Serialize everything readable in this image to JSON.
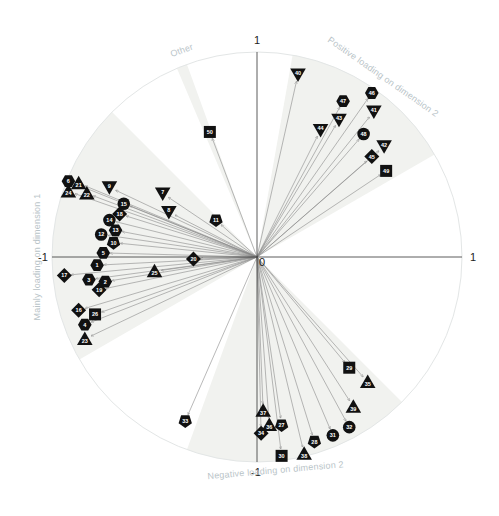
{
  "chart_data": {
    "type": "scatter",
    "subtype": "correlation-circle-biplot",
    "title": "",
    "xlabel": "Dimension 1",
    "ylabel": "Dimension 2",
    "xlim": [
      -1,
      1
    ],
    "ylim": [
      -1,
      1
    ],
    "grid": false,
    "legend": "none",
    "axis_ticks": {
      "x_left": "-1",
      "x_right": "1",
      "y_top": "1",
      "y_bottom": "-1",
      "origin": "0"
    },
    "regions": [
      {
        "name": "Mainly loading on dimension 1",
        "start_deg": 135,
        "end_deg": 210
      },
      {
        "name": "Positive loading on dimension 2",
        "start_deg": 30,
        "end_deg": 80
      },
      {
        "name": "Negative loading on dimension 2",
        "start_deg": 250,
        "end_deg": 315
      },
      {
        "name": "Other",
        "start_deg": 110,
        "end_deg": 113
      }
    ],
    "region_labels": [
      {
        "text": "Other",
        "angle_deg": 110
      },
      {
        "text": "Positive loading on dimension 2",
        "angle_deg": 55
      },
      {
        "text": "Mainly loading on dimension 1",
        "angle_deg": 180
      },
      {
        "text": "Negative loading on dimension 2",
        "angle_deg": 275
      }
    ],
    "points": [
      {
        "id": "1",
        "shape": "hexagon",
        "x": -0.78,
        "y": -0.04
      },
      {
        "id": "2",
        "shape": "hexagon",
        "x": -0.74,
        "y": -0.12
      },
      {
        "id": "3",
        "shape": "hexagon",
        "x": -0.82,
        "y": -0.11
      },
      {
        "id": "4",
        "shape": "hexagon",
        "x": -0.84,
        "y": -0.33
      },
      {
        "id": "5",
        "shape": "hexagon",
        "x": -0.75,
        "y": 0.02
      },
      {
        "id": "6",
        "shape": "hexagon",
        "x": -0.92,
        "y": 0.37
      },
      {
        "id": "7",
        "shape": "triangle-down",
        "x": -0.46,
        "y": 0.31
      },
      {
        "id": "8",
        "shape": "triangle-down",
        "x": -0.43,
        "y": 0.22
      },
      {
        "id": "9",
        "shape": "triangle-down",
        "x": -0.72,
        "y": 0.34
      },
      {
        "id": "10",
        "shape": "pentagon-down",
        "x": -0.7,
        "y": 0.07
      },
      {
        "id": "11",
        "shape": "pentagon-down",
        "x": -0.2,
        "y": 0.18
      },
      {
        "id": "12",
        "shape": "circle",
        "x": -0.76,
        "y": 0.11
      },
      {
        "id": "13",
        "shape": "hexagon",
        "x": -0.69,
        "y": 0.13
      },
      {
        "id": "14",
        "shape": "circle",
        "x": -0.72,
        "y": 0.18
      },
      {
        "id": "15",
        "shape": "circle",
        "x": -0.65,
        "y": 0.26
      },
      {
        "id": "16",
        "shape": "diamond",
        "x": -0.87,
        "y": -0.26
      },
      {
        "id": "17",
        "shape": "diamond",
        "x": -0.94,
        "y": -0.09
      },
      {
        "id": "18",
        "shape": "diamond",
        "x": -0.67,
        "y": 0.21
      },
      {
        "id": "19",
        "shape": "diamond",
        "x": -0.77,
        "y": -0.16
      },
      {
        "id": "20",
        "shape": "diamond",
        "x": -0.31,
        "y": -0.01
      },
      {
        "id": "21",
        "shape": "triangle-up",
        "x": -0.87,
        "y": 0.36
      },
      {
        "id": "22",
        "shape": "triangle-up",
        "x": -0.83,
        "y": 0.31
      },
      {
        "id": "23",
        "shape": "triangle-up",
        "x": -0.84,
        "y": -0.4
      },
      {
        "id": "24",
        "shape": "triangle-up",
        "x": -0.92,
        "y": 0.32
      },
      {
        "id": "25",
        "shape": "triangle-up",
        "x": -0.5,
        "y": -0.07
      },
      {
        "id": "26",
        "shape": "square",
        "x": -0.79,
        "y": -0.28
      },
      {
        "id": "27",
        "shape": "pentagon-down",
        "x": 0.12,
        "y": -0.82
      },
      {
        "id": "28",
        "shape": "pentagon-down",
        "x": 0.28,
        "y": -0.9
      },
      {
        "id": "29",
        "shape": "square",
        "x": 0.45,
        "y": -0.54
      },
      {
        "id": "30",
        "shape": "square",
        "x": 0.12,
        "y": -0.97
      },
      {
        "id": "31",
        "shape": "circle",
        "x": 0.37,
        "y": -0.87
      },
      {
        "id": "32",
        "shape": "circle",
        "x": 0.45,
        "y": -0.83
      },
      {
        "id": "33",
        "shape": "pentagon-down",
        "x": -0.35,
        "y": -0.8
      },
      {
        "id": "34",
        "shape": "diamond",
        "x": 0.02,
        "y": -0.86
      },
      {
        "id": "35",
        "shape": "triangle-up",
        "x": 0.54,
        "y": -0.61
      },
      {
        "id": "36",
        "shape": "triangle-up",
        "x": 0.06,
        "y": -0.82
      },
      {
        "id": "37",
        "shape": "triangle-up",
        "x": 0.03,
        "y": -0.75
      },
      {
        "id": "38",
        "shape": "triangle-up",
        "x": 0.23,
        "y": -0.96
      },
      {
        "id": "39",
        "shape": "triangle-up",
        "x": 0.47,
        "y": -0.73
      },
      {
        "id": "40",
        "shape": "triangle-down",
        "x": 0.2,
        "y": 0.89
      },
      {
        "id": "41",
        "shape": "triangle-down",
        "x": 0.57,
        "y": 0.71
      },
      {
        "id": "42",
        "shape": "triangle-down",
        "x": 0.62,
        "y": 0.54
      },
      {
        "id": "43",
        "shape": "triangle-down",
        "x": 0.4,
        "y": 0.67
      },
      {
        "id": "44",
        "shape": "triangle-down",
        "x": 0.31,
        "y": 0.62
      },
      {
        "id": "45",
        "shape": "diamond",
        "x": 0.56,
        "y": 0.49
      },
      {
        "id": "46",
        "shape": "hexagon",
        "x": 0.56,
        "y": 0.8
      },
      {
        "id": "47",
        "shape": "hexagon",
        "x": 0.42,
        "y": 0.76
      },
      {
        "id": "48",
        "shape": "circle",
        "x": 0.52,
        "y": 0.6
      },
      {
        "id": "49",
        "shape": "square",
        "x": 0.63,
        "y": 0.42
      },
      {
        "id": "50",
        "shape": "square",
        "x": -0.23,
        "y": 0.61
      }
    ]
  },
  "style": {
    "circle_stroke": "#e3e6e6",
    "sector_fill": "#f1f2ef",
    "arrow_color": "#8a8a8a",
    "axis_color": "#333333",
    "marker_fill": "#111111",
    "marker_text": "#ffffff",
    "region_label_color": "#b9c4c8"
  }
}
